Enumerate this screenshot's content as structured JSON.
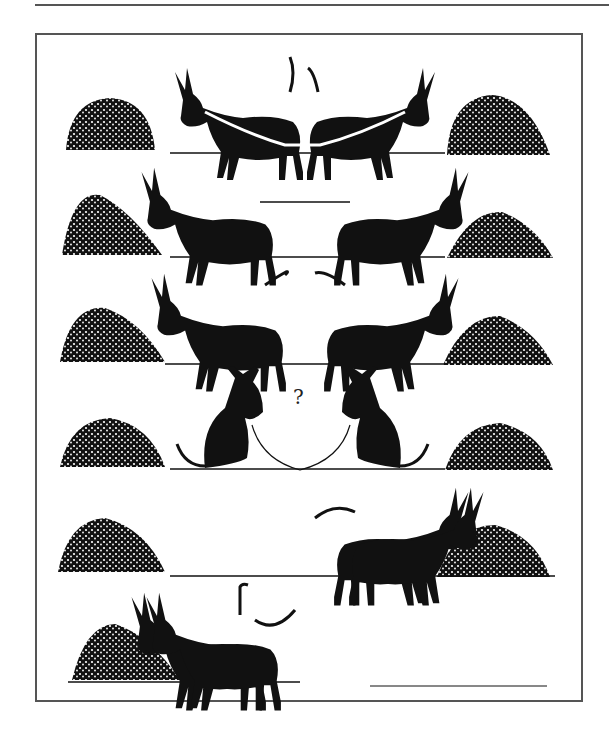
{
  "illustration": {
    "title": "Donkeys cooperation cartoon",
    "panels": 6,
    "question_mark": "?",
    "colors": {
      "ink": "#111111",
      "frame": "#555555",
      "background": "#ffffff"
    }
  }
}
